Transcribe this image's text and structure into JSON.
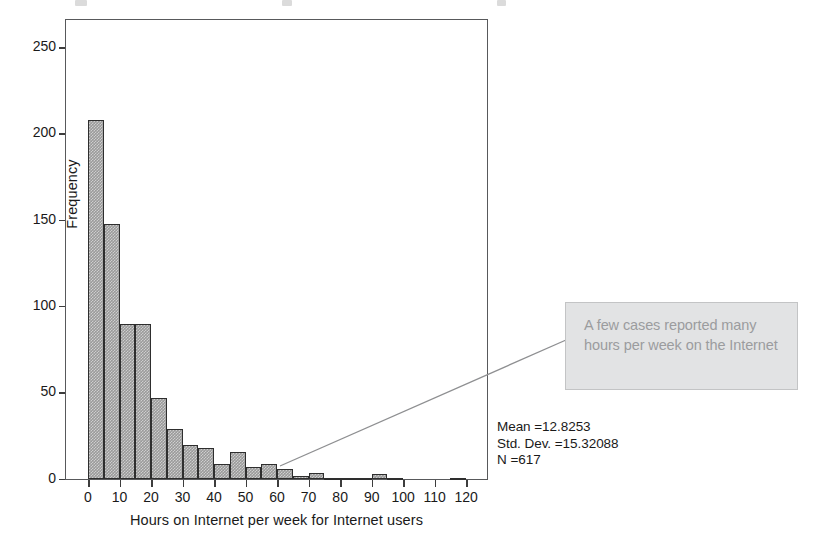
{
  "figure": {
    "y_axis_title": "Frequency",
    "x_axis_title": "Hours on Internet per week for Internet users",
    "annotation": "A few cases reported many hours per week on the Internet",
    "stats": {
      "mean": "Mean =12.8253",
      "std_dev": "Std. Dev. =15.32088",
      "n": "N =617"
    },
    "colors": {
      "bar_fill": "#9a9a9a",
      "bar_border": "#2e2e2e",
      "frame": "#58595b",
      "callout_fill": "#e2e3e4",
      "callout_text": "#9b9c9e"
    }
  },
  "chart_data": {
    "type": "bar",
    "subtype": "histogram",
    "title": "",
    "xlabel": "Hours on Internet per week for Internet users",
    "ylabel": "Frequency",
    "xlim": [
      -3,
      123
    ],
    "ylim": [
      0,
      262
    ],
    "xticks": [
      0,
      10,
      20,
      30,
      40,
      50,
      60,
      70,
      80,
      90,
      100,
      110,
      120
    ],
    "yticks": [
      0,
      50,
      100,
      150,
      200,
      250
    ],
    "xtick_labels": [
      "0",
      "10",
      "20",
      "30",
      "40",
      "50",
      "60",
      "70",
      "80",
      "90",
      "100",
      "110",
      "120"
    ],
    "ytick_labels": [
      "0",
      "50",
      "100",
      "150",
      "200",
      "250"
    ],
    "grid": false,
    "legend": null,
    "bin_width": 5,
    "bin_starts": [
      0,
      5,
      10,
      15,
      20,
      25,
      30,
      35,
      40,
      45,
      50,
      55,
      60,
      65,
      70,
      75,
      80,
      85,
      90,
      95,
      100,
      105,
      110,
      115
    ],
    "categories": [
      "0-5",
      "5-10",
      "10-15",
      "15-20",
      "20-25",
      "25-30",
      "30-35",
      "35-40",
      "40-45",
      "45-50",
      "50-55",
      "55-60",
      "60-65",
      "65-70",
      "70-75",
      "75-80",
      "80-85",
      "85-90",
      "90-95",
      "95-100",
      "100-105",
      "105-110",
      "110-115",
      "115-120"
    ],
    "values": [
      208,
      148,
      90,
      90,
      47,
      29,
      20,
      18,
      9,
      16,
      7,
      9,
      6,
      2,
      4,
      1,
      1,
      1,
      3,
      1,
      0,
      0,
      0,
      1
    ],
    "annotations": [
      {
        "text": "A few cases reported many hours per week on the Internet",
        "points_to_x": 62,
        "points_to_y": 5
      }
    ],
    "statistics": {
      "mean": 12.8253,
      "std_dev": 15.32088,
      "n": 617
    }
  }
}
